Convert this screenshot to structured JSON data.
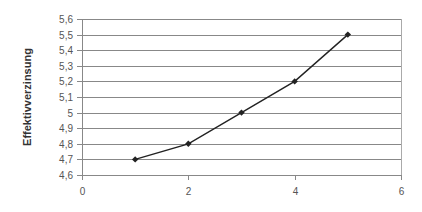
{
  "chart_data": {
    "type": "line",
    "title": "",
    "xlabel": "",
    "ylabel": "Effektivverzinsung",
    "x": [
      1,
      2,
      3,
      4,
      5
    ],
    "series": [
      {
        "name": "Effektivverzinsung",
        "values": [
          4.7,
          4.8,
          5.0,
          5.2,
          5.5
        ],
        "color": "#222222",
        "marker": "diamond"
      }
    ],
    "xlim": [
      0,
      6
    ],
    "ylim": [
      4.6,
      5.6
    ],
    "x_ticks": [
      0,
      2,
      4,
      6
    ],
    "x_tick_labels": [
      "0",
      "2",
      "4",
      "6"
    ],
    "y_ticks": [
      4.6,
      4.7,
      4.8,
      4.9,
      5.0,
      5.1,
      5.2,
      5.3,
      5.4,
      5.5,
      5.6
    ],
    "y_tick_labels": [
      "4,6",
      "4,7",
      "4,8",
      "4,9",
      "5",
      "5,1",
      "5,2",
      "5,3",
      "5,4",
      "5,5",
      "5,6"
    ],
    "grid": {
      "horizontal": true,
      "vertical": false,
      "color": "#888888"
    },
    "legend": "none"
  },
  "plot": {
    "left": 82,
    "right": 401,
    "top": 19,
    "bottom": 175
  }
}
